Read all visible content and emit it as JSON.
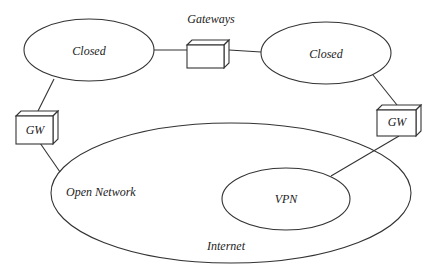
{
  "diagram": {
    "title_label": "Gateways",
    "nodes": {
      "closed_left": {
        "label": "Closed"
      },
      "closed_right": {
        "label": "Closed"
      },
      "gateway_center": {
        "label": ""
      },
      "gw_left": {
        "label": "GW"
      },
      "gw_right": {
        "label": "GW"
      },
      "internet": {
        "label": "Internet"
      },
      "open_network": {
        "label": "Open Network"
      },
      "vpn": {
        "label": "VPN"
      }
    },
    "edges": [
      {
        "from": "closed_left",
        "to": "gateway_center"
      },
      {
        "from": "gateway_center",
        "to": "closed_right"
      },
      {
        "from": "closed_left",
        "to": "gw_left"
      },
      {
        "from": "gw_left",
        "to": "internet"
      },
      {
        "from": "closed_right",
        "to": "gw_right"
      },
      {
        "from": "gw_right",
        "to": "vpn"
      }
    ]
  }
}
